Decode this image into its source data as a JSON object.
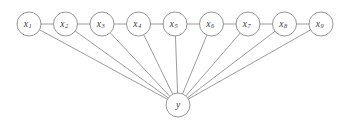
{
  "diagram": {
    "background_color": "#ffffff",
    "stroke_color": "#8a8a8a",
    "label_color": "#3a3a3a",
    "node_radius": 12,
    "variable_nodes": [
      {
        "id": "x1",
        "base": "x",
        "sub": "1",
        "cx": 29,
        "cy": 24
      },
      {
        "id": "x2",
        "base": "x",
        "sub": "2",
        "cx": 65.5,
        "cy": 24
      },
      {
        "id": "x3",
        "base": "x",
        "sub": "3",
        "cx": 102,
        "cy": 24
      },
      {
        "id": "x4",
        "base": "x",
        "sub": "4",
        "cx": 138.5,
        "cy": 24
      },
      {
        "id": "x5",
        "base": "x",
        "sub": "5",
        "cx": 175,
        "cy": 24
      },
      {
        "id": "x6",
        "base": "x",
        "sub": "6",
        "cx": 211.5,
        "cy": 24
      },
      {
        "id": "x7",
        "base": "x",
        "sub": "7",
        "cx": 248,
        "cy": 24
      },
      {
        "id": "x8",
        "base": "x",
        "sub": "8",
        "cx": 284.5,
        "cy": 24
      },
      {
        "id": "x9",
        "base": "x",
        "sub": "9",
        "cx": 321,
        "cy": 24
      }
    ],
    "target_node": {
      "id": "y",
      "base": "y",
      "sub": "",
      "cx": 178,
      "cy": 105
    },
    "chain_links": [
      {
        "from": "x1",
        "to": "x2"
      },
      {
        "from": "x2",
        "to": "x3"
      },
      {
        "from": "x3",
        "to": "x4"
      },
      {
        "from": "x4",
        "to": "x5"
      },
      {
        "from": "x5",
        "to": "x6"
      },
      {
        "from": "x6",
        "to": "x7"
      },
      {
        "from": "x7",
        "to": "x8"
      },
      {
        "from": "x8",
        "to": "x9"
      }
    ],
    "star_edges": [
      {
        "from": "x1",
        "to": "y"
      },
      {
        "from": "x2",
        "to": "y"
      },
      {
        "from": "x3",
        "to": "y"
      },
      {
        "from": "x4",
        "to": "y"
      },
      {
        "from": "x5",
        "to": "y"
      },
      {
        "from": "x6",
        "to": "y"
      },
      {
        "from": "x7",
        "to": "y"
      },
      {
        "from": "x8",
        "to": "y"
      },
      {
        "from": "x9",
        "to": "y"
      }
    ]
  }
}
